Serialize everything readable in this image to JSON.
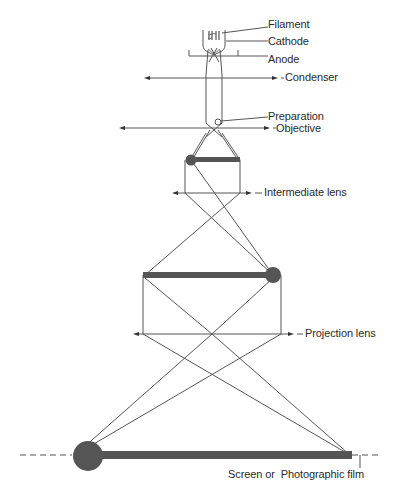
{
  "diagram": {
    "colors": {
      "line": "#555555",
      "image_bar": "#555555",
      "text": "#2a2a2a",
      "background": "#ffffff"
    },
    "labels": {
      "filament": "Filament",
      "cathode": "Cathode",
      "anode": "Anode",
      "condenser": "Condenser",
      "preparation": "Preparation",
      "objective": "Objective",
      "intermediate_lens": "Intermediate lens",
      "projection_lens": "Projection lens",
      "screen": "Screen or  Photographic film"
    },
    "components": [
      {
        "id": "filament",
        "label": "Filament"
      },
      {
        "id": "cathode",
        "label": "Cathode"
      },
      {
        "id": "anode",
        "label": "Anode"
      },
      {
        "id": "condenser",
        "label": "Condenser",
        "type": "lens"
      },
      {
        "id": "preparation",
        "label": "Preparation",
        "type": "specimen"
      },
      {
        "id": "objective",
        "label": "Objective",
        "type": "lens"
      },
      {
        "id": "intermediate",
        "label": "Intermediate lens",
        "type": "lens"
      },
      {
        "id": "projection",
        "label": "Projection lens",
        "type": "lens"
      },
      {
        "id": "screen",
        "label": "Screen or Photographic film",
        "type": "image-plane"
      }
    ],
    "images": [
      {
        "stage": "first intermediate image",
        "inverted": true
      },
      {
        "stage": "second intermediate image",
        "inverted": false
      },
      {
        "stage": "final image",
        "inverted": true
      }
    ]
  }
}
